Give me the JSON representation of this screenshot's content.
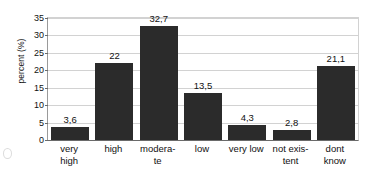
{
  "chart_data": {
    "type": "bar",
    "title": "",
    "subtitle": "",
    "xlabel": "",
    "ylabel": "percent (%)",
    "ylim": [
      0,
      35
    ],
    "ytick_step": 5,
    "yticks": [
      "0",
      "5",
      "10",
      "15",
      "20",
      "25",
      "30",
      "35"
    ],
    "grid": true,
    "legend": false,
    "decimal_separator": ",",
    "categories": [
      "very high",
      "high",
      "moderate",
      "low",
      "very low",
      "not existent",
      "dont know"
    ],
    "category_label_lines": [
      [
        "very",
        "high"
      ],
      [
        "high"
      ],
      [
        "modera-",
        "te"
      ],
      [
        "low"
      ],
      [
        "very low"
      ],
      [
        "not exis-",
        "tent"
      ],
      [
        "dont",
        "know"
      ]
    ],
    "values": [
      3.6,
      22,
      32.7,
      13.5,
      4.3,
      2.8,
      21.1
    ],
    "value_labels": [
      "3,6",
      "22",
      "32,7",
      "13,5",
      "4,3",
      "2,8",
      "21,1"
    ],
    "bar_color": "#2b2b2b",
    "grid_color": "#d2d2d2",
    "axis_color": "#6a6a6a",
    "background_color": "#ffffff"
  }
}
